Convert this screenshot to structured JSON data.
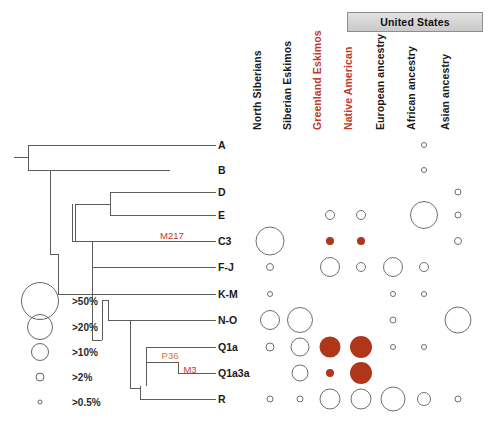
{
  "figure": {
    "group_header": {
      "label": "United States",
      "spans_columns": [
        "Native American",
        "European ancestry",
        "African ancestry",
        "Asian ancestry"
      ]
    }
  },
  "colors": {
    "highlight_red": "#c0392b",
    "bubble_fill": "#b0361a",
    "bubble_stroke": "#6e6e78",
    "branch": "#5c5c5c",
    "branch_blue": "#3b4fd8",
    "mutation_orange": "#d4703a",
    "mutation_red": "#c0392b",
    "header_box": "#d5d5d5",
    "text": "#1a1a1a"
  },
  "columns": [
    {
      "label": "North Siberians",
      "highlight": false,
      "x": 270
    },
    {
      "label": "Siberian Eskimos",
      "highlight": false,
      "x": 300
    },
    {
      "label": "Greenland Eskimos",
      "highlight": true,
      "x": 330
    },
    {
      "label": "Native American",
      "highlight": true,
      "x": 361
    },
    {
      "label": "European ancestry",
      "highlight": false,
      "x": 393
    },
    {
      "label": "African ancestry",
      "highlight": false,
      "x": 424
    },
    {
      "label": "Asian ancestry",
      "highlight": false,
      "x": 458
    }
  ],
  "rows": [
    {
      "label": "A",
      "y": 145
    },
    {
      "label": "B",
      "y": 170
    },
    {
      "label": "D",
      "y": 192
    },
    {
      "label": "E",
      "y": 215
    },
    {
      "label": "C3",
      "y": 241
    },
    {
      "label": "F-J",
      "y": 267
    },
    {
      "label": "K-M",
      "y": 294
    },
    {
      "label": "N-O",
      "y": 320
    },
    {
      "label": "Q1a",
      "y": 347
    },
    {
      "label": "Q1a3a",
      "y": 373
    },
    {
      "label": "R",
      "y": 399
    }
  ],
  "size_legend": {
    "items": [
      {
        "label": ">50%",
        "diameter": 38,
        "cy": 301
      },
      {
        "label": ">20%",
        "diameter": 26,
        "cy": 327
      },
      {
        "label": ">10%",
        "diameter": 18,
        "cy": 352
      },
      {
        "label": ">2%",
        "diameter": 9,
        "cy": 377
      },
      {
        "label": ">0.5%",
        "diameter": 5,
        "cy": 402
      }
    ],
    "circle_cx": 40,
    "label_x": 72
  },
  "chart_data": {
    "type": "bubble",
    "xlabel": "Population",
    "ylabel": "Haplogroup",
    "categories_x": [
      "North Siberians",
      "Siberian Eskimos",
      "Greenland Eskimos",
      "Native American",
      "European ancestry",
      "African ancestry",
      "Asian ancestry"
    ],
    "categories_y": [
      "A",
      "B",
      "D",
      "E",
      "C3",
      "F-J",
      "K-M",
      "N-O",
      "Q1a",
      "Q1a3a",
      "R"
    ],
    "size_scale": [
      ">0.5%",
      ">2%",
      ">10%",
      ">20%",
      ">50%"
    ],
    "legend_position": "lower-left",
    "grid": false,
    "points": [
      {
        "row": "A",
        "col": "African ancestry",
        "size": 6,
        "filled": false
      },
      {
        "row": "B",
        "col": "African ancestry",
        "size": 6,
        "filled": false
      },
      {
        "row": "D",
        "col": "Asian ancestry",
        "size": 7,
        "filled": false
      },
      {
        "row": "E",
        "col": "Greenland Eskimos",
        "size": 10,
        "filled": false
      },
      {
        "row": "E",
        "col": "Native American",
        "size": 10,
        "filled": false
      },
      {
        "row": "E",
        "col": "African ancestry",
        "size": 28,
        "filled": false
      },
      {
        "row": "E",
        "col": "Asian ancestry",
        "size": 7,
        "filled": false
      },
      {
        "row": "C3",
        "col": "North Siberians",
        "size": 29,
        "filled": false
      },
      {
        "row": "C3",
        "col": "Greenland Eskimos",
        "size": 8,
        "filled": true
      },
      {
        "row": "C3",
        "col": "Native American",
        "size": 8,
        "filled": true
      },
      {
        "row": "C3",
        "col": "Asian ancestry",
        "size": 8,
        "filled": false
      },
      {
        "row": "F-J",
        "col": "North Siberians",
        "size": 8,
        "filled": false
      },
      {
        "row": "F-J",
        "col": "Greenland Eskimos",
        "size": 20,
        "filled": false
      },
      {
        "row": "F-J",
        "col": "Native American",
        "size": 10,
        "filled": false
      },
      {
        "row": "F-J",
        "col": "European ancestry",
        "size": 20,
        "filled": false
      },
      {
        "row": "F-J",
        "col": "African ancestry",
        "size": 10,
        "filled": false
      },
      {
        "row": "K-M",
        "col": "North Siberians",
        "size": 6,
        "filled": false
      },
      {
        "row": "K-M",
        "col": "European ancestry",
        "size": 6,
        "filled": false
      },
      {
        "row": "K-M",
        "col": "African ancestry",
        "size": 6,
        "filled": false
      },
      {
        "row": "N-O",
        "col": "North Siberians",
        "size": 20,
        "filled": false
      },
      {
        "row": "N-O",
        "col": "Siberian Eskimos",
        "size": 26,
        "filled": false
      },
      {
        "row": "N-O",
        "col": "European ancestry",
        "size": 7,
        "filled": false
      },
      {
        "row": "N-O",
        "col": "Asian ancestry",
        "size": 27,
        "filled": false
      },
      {
        "row": "Q1a",
        "col": "North Siberians",
        "size": 9,
        "filled": false
      },
      {
        "row": "Q1a",
        "col": "Siberian Eskimos",
        "size": 19,
        "filled": false
      },
      {
        "row": "Q1a",
        "col": "Greenland Eskimos",
        "size": 21,
        "filled": true
      },
      {
        "row": "Q1a",
        "col": "Native American",
        "size": 22,
        "filled": true
      },
      {
        "row": "Q1a",
        "col": "European ancestry",
        "size": 6,
        "filled": false
      },
      {
        "row": "Q1a",
        "col": "African ancestry",
        "size": 6,
        "filled": false
      },
      {
        "row": "Q1a3a",
        "col": "Siberian Eskimos",
        "size": 17,
        "filled": false
      },
      {
        "row": "Q1a3a",
        "col": "Greenland Eskimos",
        "size": 8,
        "filled": true
      },
      {
        "row": "Q1a3a",
        "col": "Native American",
        "size": 22,
        "filled": true
      },
      {
        "row": "R",
        "col": "North Siberians",
        "size": 7,
        "filled": false
      },
      {
        "row": "R",
        "col": "Siberian Eskimos",
        "size": 7,
        "filled": false
      },
      {
        "row": "R",
        "col": "Greenland Eskimos",
        "size": 21,
        "filled": false
      },
      {
        "row": "R",
        "col": "Native American",
        "size": 21,
        "filled": false
      },
      {
        "row": "R",
        "col": "European ancestry",
        "size": 25,
        "filled": false
      },
      {
        "row": "R",
        "col": "African ancestry",
        "size": 14,
        "filled": false
      },
      {
        "row": "R",
        "col": "Asian ancestry",
        "size": 7,
        "filled": false
      }
    ]
  },
  "tree": {
    "mutations": [
      {
        "label": "M217",
        "x": 172,
        "y": 235,
        "color": "#c0392b"
      },
      {
        "label": "P36",
        "x": 170,
        "y": 355,
        "color": "#d4703a"
      },
      {
        "label": "M3",
        "x": 190,
        "y": 369,
        "color": "#c0392b"
      }
    ],
    "tip_label_x": 218,
    "branches": [
      {
        "type": "h",
        "x": 28,
        "y": 145,
        "len": 188
      },
      {
        "type": "h",
        "x": 28,
        "y": 170,
        "len": 188
      },
      {
        "type": "h",
        "x": 70,
        "y": 192,
        "len": 146
      },
      {
        "type": "h",
        "x": 70,
        "y": 215,
        "len": 146
      },
      {
        "type": "h",
        "x": 60,
        "y": 241,
        "len": 156
      },
      {
        "type": "h",
        "x": 84,
        "y": 267,
        "len": 132
      },
      {
        "type": "h",
        "x": 58,
        "y": 294,
        "len": 158
      },
      {
        "type": "h",
        "x": 96,
        "y": 320,
        "len": 120
      },
      {
        "type": "h",
        "x": 138,
        "y": 347,
        "len": 78
      },
      {
        "type": "h",
        "x": 160,
        "y": 373,
        "len": 56
      },
      {
        "type": "h",
        "x": 120,
        "y": 399,
        "len": 96
      }
    ]
  }
}
